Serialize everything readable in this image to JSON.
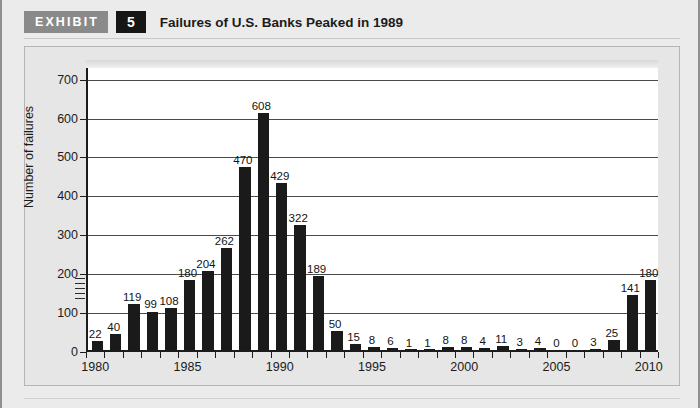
{
  "header": {
    "exhibit_tag": "EXHIBIT",
    "exhibit_number": "5",
    "title": "Failures of U.S. Banks Peaked in 1989"
  },
  "chart_data": {
    "type": "bar",
    "title": "Failures of U.S. Banks Peaked in 1989",
    "xlabel": "",
    "ylabel": "Number of failures",
    "ylim": [
      0,
      730
    ],
    "yticks": [
      0,
      100,
      200,
      300,
      400,
      500,
      600,
      700
    ],
    "grid": true,
    "legend": null,
    "xtick_labels": [
      "1980",
      "1985",
      "1990",
      "1995",
      "2000",
      "2005",
      "2010"
    ],
    "categories": [
      "1980",
      "1981",
      "1982",
      "1983",
      "1984",
      "1985",
      "1986",
      "1987",
      "1988",
      "1989",
      "1990",
      "1991",
      "1992",
      "1993",
      "1994",
      "1995",
      "1996",
      "1997",
      "1998",
      "1999",
      "2000",
      "2001",
      "2002",
      "2003",
      "2004",
      "2005",
      "2006",
      "2007",
      "2008",
      "2009",
      "2010"
    ],
    "values": [
      22,
      40,
      119,
      99,
      108,
      180,
      204,
      262,
      470,
      608,
      429,
      322,
      189,
      50,
      15,
      8,
      6,
      1,
      1,
      8,
      8,
      4,
      11,
      3,
      4,
      0,
      0,
      3,
      25,
      141,
      180
    ],
    "bar_color": "#1a1a1a",
    "plot_background": "#ffffff",
    "page_background": "#e9e9e9"
  }
}
